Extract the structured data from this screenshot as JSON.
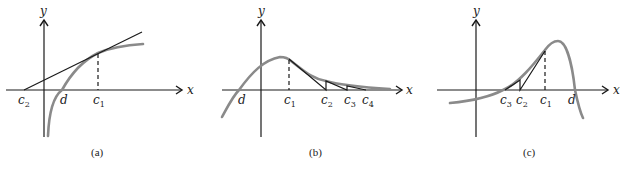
{
  "figure": {
    "panels": [
      {
        "caption": "(a)",
        "axis_x": "x",
        "axis_y": "y",
        "labels": {
          "c2": "c",
          "c2_sub": "2",
          "d": "d",
          "c1": "c",
          "c1_sub": "1"
        }
      },
      {
        "caption": "(b)",
        "axis_x": "x",
        "axis_y": "y",
        "labels": {
          "d": "d",
          "c1": "c",
          "c1_sub": "1",
          "c2": "c",
          "c2_sub": "2",
          "c3": "c",
          "c3_sub": "3",
          "c4": "c",
          "c4_sub": "4"
        }
      },
      {
        "caption": "(c)",
        "axis_x": "x",
        "axis_y": "y",
        "labels": {
          "c3": "c",
          "c3_sub": "3",
          "c2": "c",
          "c2_sub": "2",
          "c1": "c",
          "c1_sub": "1",
          "d": "d"
        }
      }
    ],
    "colors": {
      "curve": "#8a8a8a",
      "lines": "#1a1a1a",
      "background": "#ffffff"
    }
  }
}
